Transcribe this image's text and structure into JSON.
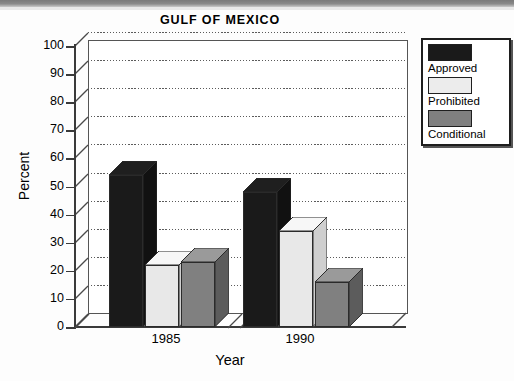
{
  "chart_data": {
    "type": "bar",
    "title": "GULF OF MEXICO",
    "xlabel": "Year",
    "ylabel": "Percent",
    "categories": [
      "1985",
      "1990"
    ],
    "series": [
      {
        "name": "Approved",
        "values": [
          54,
          48
        ],
        "color": "#1a1a1a"
      },
      {
        "name": "Prohibited",
        "values": [
          22,
          34
        ],
        "color": "#e8e8e8"
      },
      {
        "name": "Conditional",
        "values": [
          23,
          16
        ],
        "color": "#808080"
      }
    ],
    "ylim": [
      0,
      100
    ],
    "yticks": [
      0,
      10,
      20,
      30,
      40,
      50,
      60,
      70,
      80,
      90,
      100
    ],
    "grid": true,
    "legend_position": "top-right",
    "style": "3d-bar"
  },
  "axes": {
    "y_tick_labels": [
      "100",
      "90",
      "80",
      "70",
      "60",
      "50",
      "40",
      "30",
      "20",
      "10",
      "0"
    ],
    "x_tick_labels": [
      "1985",
      "1990"
    ]
  },
  "legend": {
    "entries": [
      {
        "label": "Approved"
      },
      {
        "label": "Prohibited"
      },
      {
        "label": "Conditional"
      }
    ]
  }
}
